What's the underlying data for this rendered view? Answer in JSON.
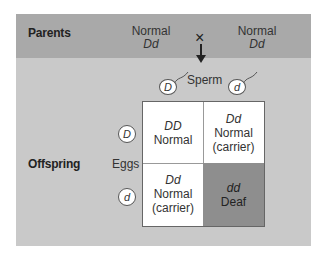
{
  "header": {
    "parents_label": "Parents",
    "parent1": {
      "phenotype": "Normal",
      "genotype": "Dd"
    },
    "parent2": {
      "phenotype": "Normal",
      "genotype": "Dd"
    },
    "cross_symbol": "×"
  },
  "sperm": {
    "label": "Sperm",
    "alleles": [
      "D",
      "d"
    ]
  },
  "eggs": {
    "label": "Eggs",
    "alleles": [
      "D",
      "d"
    ]
  },
  "offspring_label": "Offspring",
  "grid": [
    {
      "genotype": "DD",
      "phenotype": "Normal",
      "note": ""
    },
    {
      "genotype": "Dd",
      "phenotype": "Normal",
      "note": "(carrier)"
    },
    {
      "genotype": "Dd",
      "phenotype": "Normal",
      "note": "(carrier)"
    },
    {
      "genotype": "dd",
      "phenotype": "Deaf",
      "note": ""
    }
  ],
  "colors": {
    "header": "#a9a9a9",
    "panel": "#c9c9c9",
    "deaf_cell": "#8e8e8e",
    "cell": "#ffffff"
  }
}
